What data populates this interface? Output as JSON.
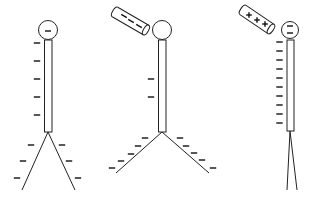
{
  "diagram": {
    "colors": {
      "stroke": "#222222",
      "background": "#ffffff"
    },
    "electroscopes": [
      {
        "id": "electroscope-1",
        "ball": {
          "cx": 48,
          "cy": 30,
          "r": 9.5,
          "charges": [
            {
              "sign": "-",
              "x": 48,
              "y": 31
            }
          ]
        },
        "rod": {
          "x": 44.5,
          "y": 40,
          "w": 7.5,
          "h": 92
        },
        "rod_charges": {
          "x": 37,
          "ys": [
            43,
            61,
            79,
            97,
            115
          ],
          "sign": "-"
        },
        "leaves": {
          "apex": [
            48,
            132
          ],
          "left_end": [
            22,
            190
          ],
          "right_end": [
            75,
            190
          ]
        },
        "leaf_charges": [
          [
            31,
            145
          ],
          [
            23,
            161
          ],
          [
            17,
            178
          ],
          [
            62,
            145
          ],
          [
            69,
            161
          ],
          [
            78,
            178
          ]
        ],
        "charged_rod": null
      },
      {
        "id": "electroscope-2",
        "ball": {
          "cx": 162,
          "cy": 30,
          "r": 9.5,
          "charges": []
        },
        "rod": {
          "x": 158.5,
          "y": 40,
          "w": 7.5,
          "h": 92
        },
        "rod_charges": {
          "x": 151,
          "ys": [
            79,
            97
          ],
          "sign": "-"
        },
        "leaves": {
          "apex": [
            162,
            132
          ],
          "left_end": [
            116,
            173
          ],
          "right_end": [
            209,
            173
          ]
        },
        "leaf_charges": [
          [
            145,
            138
          ],
          [
            138,
            146
          ],
          [
            131,
            154
          ],
          [
            121,
            161
          ],
          [
            112,
            168
          ],
          [
            180,
            138
          ],
          [
            186,
            146
          ],
          [
            194,
            153
          ],
          [
            202,
            160
          ],
          [
            213,
            168
          ]
        ],
        "charged_rod": {
          "label": "- - -",
          "charge": "negative",
          "x1": 115,
          "y1": 12,
          "x2": 146,
          "y2": 30,
          "signs": [
            [
              124,
              16
            ],
            [
              131,
              21
            ],
            [
              139,
              26
            ]
          ]
        }
      },
      {
        "id": "electroscope-3",
        "ball": {
          "cx": 290,
          "cy": 30,
          "r": 8.5,
          "charges": [
            {
              "sign": "-",
              "x": 290,
              "y": 26
            },
            {
              "sign": "-",
              "x": 290,
              "y": 33
            }
          ]
        },
        "rod": {
          "x": 287,
          "y": 40,
          "w": 7,
          "h": 91
        },
        "rod_charges": {
          "x": 279.5,
          "ys": [
            42,
            51,
            60,
            69,
            78,
            87,
            96,
            105,
            114,
            123
          ],
          "sign": "-"
        },
        "leaves": {
          "apex": [
            290,
            131
          ],
          "left_end": [
            287,
            190
          ],
          "right_end": [
            297,
            190
          ]
        },
        "leaf_charges": [],
        "charged_rod": {
          "label": "+++",
          "charge": "positive",
          "x1": 243,
          "y1": 10,
          "x2": 271,
          "y2": 29,
          "signs": [
            [
              249,
              15
            ],
            [
              257,
              20
            ],
            [
              265,
              24
            ]
          ]
        }
      }
    ]
  }
}
